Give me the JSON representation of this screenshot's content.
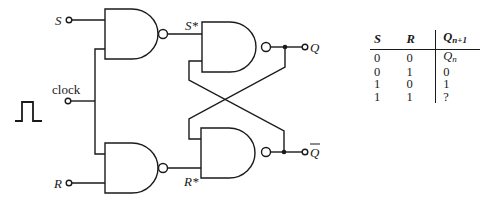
{
  "diagram": {
    "inputs": {
      "S_label": "S",
      "R_label": "R",
      "clock_label": "clock"
    },
    "intermediate": {
      "S_star_label": "S*",
      "R_star_label": "R*"
    },
    "outputs": {
      "Q_label": "Q",
      "Qbar_label": "Q"
    },
    "clock_pulse_icon": "single-pulse-waveform",
    "gates": [
      {
        "id": "nand-S",
        "type": "NAND",
        "inputs": [
          "S",
          "clock"
        ],
        "output": "S*"
      },
      {
        "id": "nand-R",
        "type": "NAND",
        "inputs": [
          "clock",
          "R"
        ],
        "output": "R*"
      },
      {
        "id": "nand-Q",
        "type": "NAND",
        "inputs": [
          "S*",
          "Qbar"
        ],
        "output": "Q"
      },
      {
        "id": "nand-Qbar",
        "type": "NAND",
        "inputs": [
          "Q",
          "R*"
        ],
        "output": "Qbar"
      }
    ],
    "line_color": "#1a1a1a"
  },
  "truth_table": {
    "headers": {
      "S": "S",
      "R": "R",
      "Q": "Q",
      "Q_sub": "n+1"
    },
    "rows": [
      {
        "S": "0",
        "R": "0",
        "Q": "Q",
        "Q_sub": "n"
      },
      {
        "S": "0",
        "R": "1",
        "Q": "0",
        "Q_sub": ""
      },
      {
        "S": "1",
        "R": "0",
        "Q": "1",
        "Q_sub": ""
      },
      {
        "S": "1",
        "R": "1",
        "Q": "?",
        "Q_sub": ""
      }
    ]
  }
}
